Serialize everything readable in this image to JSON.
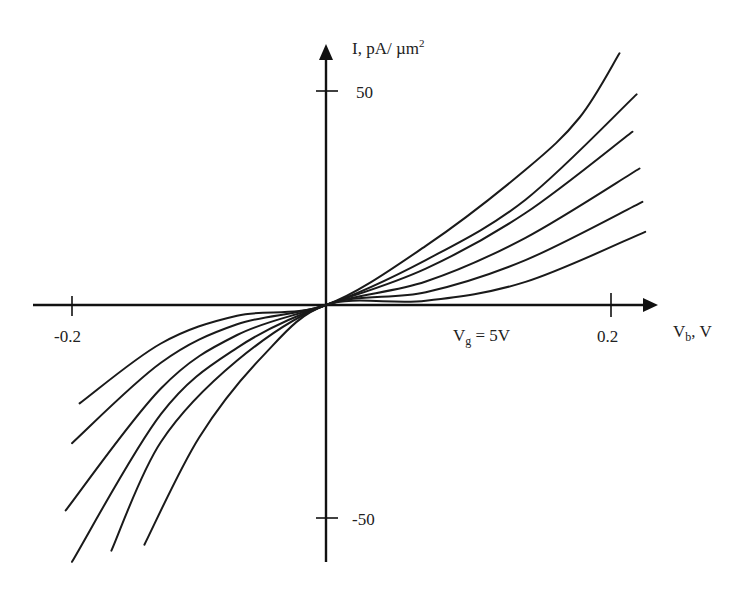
{
  "chart_data": {
    "type": "line",
    "title": "",
    "xlabel": "V_b, V",
    "ylabel": "I, pA/ µm²",
    "xlim": [
      -0.2,
      0.2
    ],
    "ylim": [
      -50,
      50
    ],
    "grid": false,
    "legend": null,
    "x_ticks": [
      -0.2,
      0.2
    ],
    "x_tick_labels": [
      "-0.2",
      "0.2"
    ],
    "y_ticks": [
      50,
      -50
    ],
    "y_tick_labels": [
      "50",
      "-50"
    ],
    "annotations": [
      {
        "text": "V_g = 5V",
        "x": 0.1,
        "y": -5
      }
    ],
    "series": [
      {
        "name": "curve-1",
        "points": [
          [
            -0.194,
            -23
          ],
          [
            -0.13,
            -9
          ],
          [
            -0.07,
            -2.5
          ],
          [
            0,
            0
          ],
          [
            0.07,
            13.8
          ],
          [
            0.14,
            31.6
          ],
          [
            0.178,
            43.8
          ],
          [
            0.206,
            58.8
          ]
        ]
      },
      {
        "name": "curve-2",
        "points": [
          [
            -0.2,
            -32.3
          ],
          [
            -0.13,
            -13.5
          ],
          [
            -0.07,
            -4.5
          ],
          [
            0,
            0
          ],
          [
            0.07,
            10.5
          ],
          [
            0.14,
            24.6
          ],
          [
            0.218,
            49.2
          ]
        ]
      },
      {
        "name": "curve-3",
        "points": [
          [
            -0.205,
            -48
          ],
          [
            -0.13,
            -19.5
          ],
          [
            -0.07,
            -7
          ],
          [
            0,
            0
          ],
          [
            0.07,
            8.5
          ],
          [
            0.14,
            21.5
          ],
          [
            0.215,
            40.5
          ]
        ]
      },
      {
        "name": "curve-4",
        "points": [
          [
            -0.2,
            -60
          ],
          [
            -0.13,
            -25.5
          ],
          [
            -0.07,
            -10
          ],
          [
            0,
            0
          ],
          [
            0.07,
            5.5
          ],
          [
            0.14,
            15.7
          ],
          [
            0.22,
            31.9
          ]
        ]
      },
      {
        "name": "curve-5",
        "points": [
          [
            -0.169,
            -57.4
          ],
          [
            -0.13,
            -32
          ],
          [
            -0.07,
            -13
          ],
          [
            0,
            0
          ],
          [
            0.07,
            3
          ],
          [
            0.14,
            10.5
          ],
          [
            0.222,
            24.1
          ]
        ]
      },
      {
        "name": "curve-6",
        "points": [
          [
            -0.143,
            -56
          ],
          [
            -0.1,
            -31
          ],
          [
            -0.05,
            -12
          ],
          [
            0,
            0
          ],
          [
            0.07,
            1
          ],
          [
            0.14,
            5.4
          ],
          [
            0.224,
            17.1
          ]
        ]
      }
    ]
  },
  "labels": {
    "y_axis_title": "I, pA/ µm",
    "y_axis_title_sup": "2",
    "x_axis_title_main": "V",
    "x_axis_title_sub": "b",
    "x_axis_title_tail": ", V",
    "annotation_main": "V",
    "annotation_sub": "g",
    "annotation_tail": " = 5V",
    "tick_x_neg": "-0.2",
    "tick_x_pos": "0.2",
    "tick_y_pos": "50",
    "tick_y_neg": "-50"
  },
  "colors": {
    "line": "#1a1a1a",
    "axis": "#111111",
    "background": "#ffffff"
  }
}
